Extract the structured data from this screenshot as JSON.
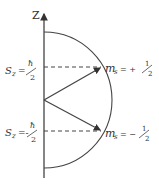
{
  "diagram": {
    "axis_label": "Z",
    "upper_level": {
      "left_label_prefix": "S",
      "left_label_sub": "z",
      "left_label_eq": "=",
      "left_label_num": "ħ",
      "left_label_den": "2",
      "right_label_prefix": "m",
      "right_label_sub": "s",
      "right_label_eq": "= +",
      "right_label_num": "1",
      "right_label_den": "2"
    },
    "lower_level": {
      "left_label_prefix": "S",
      "left_label_sub": "z",
      "left_label_eq": "=-",
      "left_label_num": "ħ",
      "left_label_den": "2",
      "right_label_prefix": "m",
      "right_label_sub": "s",
      "right_label_eq": "= −",
      "right_label_num": "1",
      "right_label_den": "2"
    },
    "stroke_color": "#444444"
  }
}
